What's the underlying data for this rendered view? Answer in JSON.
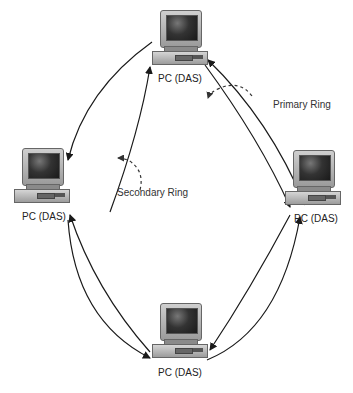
{
  "nodes": [
    {
      "id": "top",
      "label": "PC (DAS)"
    },
    {
      "id": "left",
      "label": "PC (DAS)"
    },
    {
      "id": "right",
      "label": "PC (DAS)"
    },
    {
      "id": "bottom",
      "label": "PC (DAS)"
    }
  ],
  "annotations": {
    "primary_ring": "Primary Ring",
    "secondary_ring": "Secondary Ring"
  },
  "colors": {
    "line": "#1a1a1a",
    "background": "#ffffff"
  }
}
